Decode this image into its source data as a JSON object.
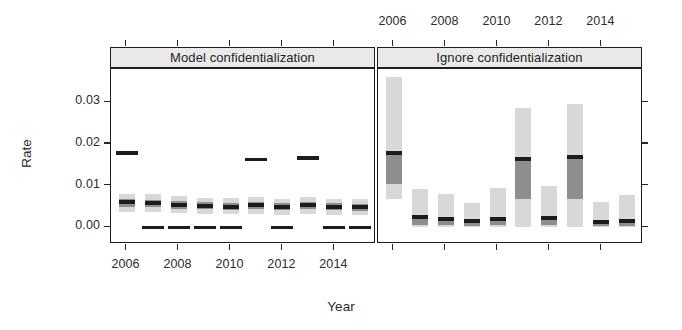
{
  "chart_data": {
    "type": "boxplot",
    "title": "",
    "xlabel": "Year",
    "ylabel": "Rate",
    "ylim": [
      -0.004,
      0.038
    ],
    "ytick_values": [
      0.0,
      0.01,
      0.02,
      0.03
    ],
    "ytick_labels": [
      "0.00",
      "0.01",
      "0.02",
      "0.03"
    ],
    "xtick_values": [
      2006,
      2008,
      2010,
      2012,
      2014
    ],
    "xtick_labels_bottom": [
      "2006",
      "2008",
      "2010",
      "2012",
      "2014"
    ],
    "xtick_labels_top": [
      "2006",
      "2008",
      "2010",
      "2012",
      "2014"
    ],
    "grid": false,
    "legend": "none",
    "xlim": [
      2005.4,
      2015.6
    ],
    "colors": {
      "whisker_fill": "#d8d8d8",
      "box_fill": "#8e8e8e",
      "median": "#1c1c1c",
      "outlier": "#1c1c1c",
      "strip_fill": "#e9e9e9",
      "frame": "#1f1f1f",
      "background": "#ffffff"
    },
    "panels": [
      {
        "name": "model-confidentialization",
        "label": "Model confidentialization",
        "position": "left",
        "boxes": [
          {
            "year": 2006,
            "whisker_low": 0.0038,
            "q1": 0.005,
            "median": 0.006,
            "q3": 0.0068,
            "whisker_high": 0.008,
            "outliers": [
              0.0178
            ]
          },
          {
            "year": 2007,
            "whisker_low": 0.0036,
            "q1": 0.0048,
            "median": 0.0058,
            "q3": 0.0066,
            "whisker_high": 0.0079,
            "outliers": [
              0.0
            ]
          },
          {
            "year": 2008,
            "whisker_low": 0.0034,
            "q1": 0.0045,
            "median": 0.0054,
            "q3": 0.0063,
            "whisker_high": 0.0075,
            "outliers": [
              0.0
            ]
          },
          {
            "year": 2009,
            "whisker_low": 0.0032,
            "q1": 0.0043,
            "median": 0.0051,
            "q3": 0.006,
            "whisker_high": 0.0071,
            "outliers": [
              0.0
            ]
          },
          {
            "year": 2010,
            "whisker_low": 0.0031,
            "q1": 0.0042,
            "median": 0.005,
            "q3": 0.0059,
            "whisker_high": 0.007,
            "outliers": [
              0.0
            ]
          },
          {
            "year": 2011,
            "whisker_low": 0.0033,
            "q1": 0.0044,
            "median": 0.0053,
            "q3": 0.0062,
            "whisker_high": 0.0074,
            "outliers": [
              0.0163
            ]
          },
          {
            "year": 2012,
            "whisker_low": 0.003,
            "q1": 0.0041,
            "median": 0.0049,
            "q3": 0.0058,
            "whisker_high": 0.0069,
            "outliers": [
              0.0
            ]
          },
          {
            "year": 2013,
            "whisker_low": 0.0033,
            "q1": 0.0044,
            "median": 0.0053,
            "q3": 0.0062,
            "whisker_high": 0.0073,
            "outliers": [
              0.0167
            ]
          },
          {
            "year": 2014,
            "whisker_low": 0.003,
            "q1": 0.0041,
            "median": 0.0049,
            "q3": 0.0058,
            "whisker_high": 0.0069,
            "outliers": [
              0.0
            ]
          },
          {
            "year": 2015,
            "whisker_low": 0.0029,
            "q1": 0.004,
            "median": 0.0048,
            "q3": 0.0057,
            "whisker_high": 0.0068,
            "outliers": [
              0.0
            ]
          }
        ]
      },
      {
        "name": "ignore-confidentialization",
        "label": "Ignore confidentialization",
        "position": "right",
        "boxes": [
          {
            "year": 2006,
            "whisker_low": 0.0068,
            "q1": 0.0105,
            "median": 0.0178,
            "q3": 0.0182,
            "whisker_high": 0.0362,
            "outliers": []
          },
          {
            "year": 2007,
            "whisker_low": 0.0,
            "q1": 0.0005,
            "median": 0.0024,
            "q3": 0.0029,
            "whisker_high": 0.0091,
            "outliers": []
          },
          {
            "year": 2008,
            "whisker_low": 0.0,
            "q1": 0.0005,
            "median": 0.002,
            "q3": 0.0025,
            "whisker_high": 0.0081,
            "outliers": []
          },
          {
            "year": 2009,
            "whisker_low": 0.0,
            "q1": 0.0004,
            "median": 0.0016,
            "q3": 0.002,
            "whisker_high": 0.0058,
            "outliers": []
          },
          {
            "year": 2010,
            "whisker_low": 0.0,
            "q1": 0.0005,
            "median": 0.0019,
            "q3": 0.0024,
            "whisker_high": 0.0094,
            "outliers": []
          },
          {
            "year": 2011,
            "whisker_low": 0.0,
            "q1": 0.0068,
            "median": 0.0163,
            "q3": 0.0167,
            "whisker_high": 0.0287,
            "outliers": []
          },
          {
            "year": 2012,
            "whisker_low": 0.0,
            "q1": 0.0005,
            "median": 0.0022,
            "q3": 0.0027,
            "whisker_high": 0.01,
            "outliers": []
          },
          {
            "year": 2013,
            "whisker_low": 0.0,
            "q1": 0.0069,
            "median": 0.0168,
            "q3": 0.0172,
            "whisker_high": 0.0296,
            "outliers": []
          },
          {
            "year": 2014,
            "whisker_low": 0.0,
            "q1": 0.0003,
            "median": 0.0013,
            "q3": 0.0017,
            "whisker_high": 0.006,
            "outliers": []
          },
          {
            "year": 2015,
            "whisker_low": 0.0,
            "q1": 0.0004,
            "median": 0.0015,
            "q3": 0.0019,
            "whisker_high": 0.0077,
            "outliers": []
          }
        ]
      }
    ]
  }
}
